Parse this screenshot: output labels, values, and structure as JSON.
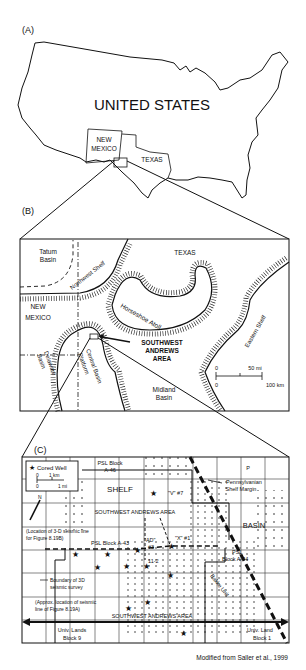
{
  "panels": {
    "a": {
      "label": "(A)",
      "country": "UNITED STATES",
      "states": [
        "NEW",
        "MEXICO",
        "TEXAS"
      ]
    },
    "b": {
      "label": "(B)",
      "basins": {
        "tatum": [
          "Tatum",
          "Basin"
        ],
        "delaware": [
          "Delaware",
          "Basin"
        ],
        "midland": [
          "Midland",
          "Basin"
        ]
      },
      "state_texas": "TEXAS",
      "state_nm": [
        "NEW",
        "MEXICO"
      ],
      "features": {
        "northwest_shelf": "Northwest Shelf",
        "horseshoe_atoll": "Horseshoe Atoll",
        "eastern_shelf": "Eastern Shelf",
        "central_basin_platform": [
          "Central Basin",
          "Platform"
        ]
      },
      "study_area": [
        "SOUTHWEST",
        "ANDREWS",
        "AREA"
      ],
      "scale": {
        "zero_top": "0",
        "mi": "50 mi",
        "zero_bottom": "0",
        "km": "100 km"
      }
    },
    "c": {
      "label": "(C)",
      "legend": {
        "cored_well": "Cored Well",
        "zero_km": "0",
        "km": "1 km",
        "zero_mi": "0",
        "mi": "1 mi",
        "north": "N"
      },
      "shelf": "SHELF",
      "basin": "BASIN",
      "psl_a46": [
        "PSL Block",
        "A-46"
      ],
      "psl_a45": "PSL Block A-45",
      "psl_a43": "PSL Block A-43",
      "psl_a44": [
        "PSL",
        "Block A-44"
      ],
      "margin": [
        "Pennsylvanian",
        "Shelf Margin"
      ],
      "swa_top": "SOUTHWEST ANDREWS AREA",
      "swa_bottom": "SOUTHWEST ANDREWS AREA",
      "wells": {
        "v7": "\"V\" #7",
        "x1": "\"X\" #1",
        "ad": "\"AD\"",
        "ad3": "#3",
        "w112": "11-2"
      },
      "seismic_3d": [
        "(Location of 3-D seismic line",
        "for Figure 8.19B)"
      ],
      "boundary": [
        "Boundary of 3D",
        "seismic survey"
      ],
      "seismic_approx": [
        "(Approx. location of seismic",
        "line of Figure 8.19A)"
      ],
      "bakke": "Bakke Unit",
      "univ9": [
        "Univ. Lands",
        "Block 9"
      ],
      "univ1": [
        "Univ. Land",
        "Block 1"
      ]
    }
  },
  "credit": "Modified from Saller et al., 1999"
}
